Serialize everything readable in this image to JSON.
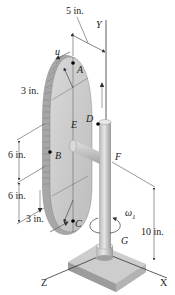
{
  "figure": {
    "type": "engineering-mechanics-diagram",
    "axes": {
      "y": "Y",
      "x": "X",
      "z": "Z"
    },
    "points": {
      "a": "A",
      "b": "B",
      "c": "C",
      "d": "D",
      "e": "E",
      "f": "F",
      "g": "G"
    },
    "dimensions": {
      "top_offset": "5 in.",
      "radius_top": "3 in.",
      "upper_half": "6 in.",
      "lower_half": "6 in.",
      "radius_bottom": "3 in.",
      "height": "10 in."
    },
    "velocity_label": "u",
    "angular_velocity_label": "ω",
    "angular_velocity_subscript": "1",
    "colors": {
      "plate_face": "#c9c9c9",
      "plate_rim": "#a8a8a8",
      "shaft": "#cfcfcf",
      "shaft_shade": "#9e9e9e",
      "base": "#bdbdbd",
      "line": "#333333",
      "point": "#000000"
    }
  }
}
